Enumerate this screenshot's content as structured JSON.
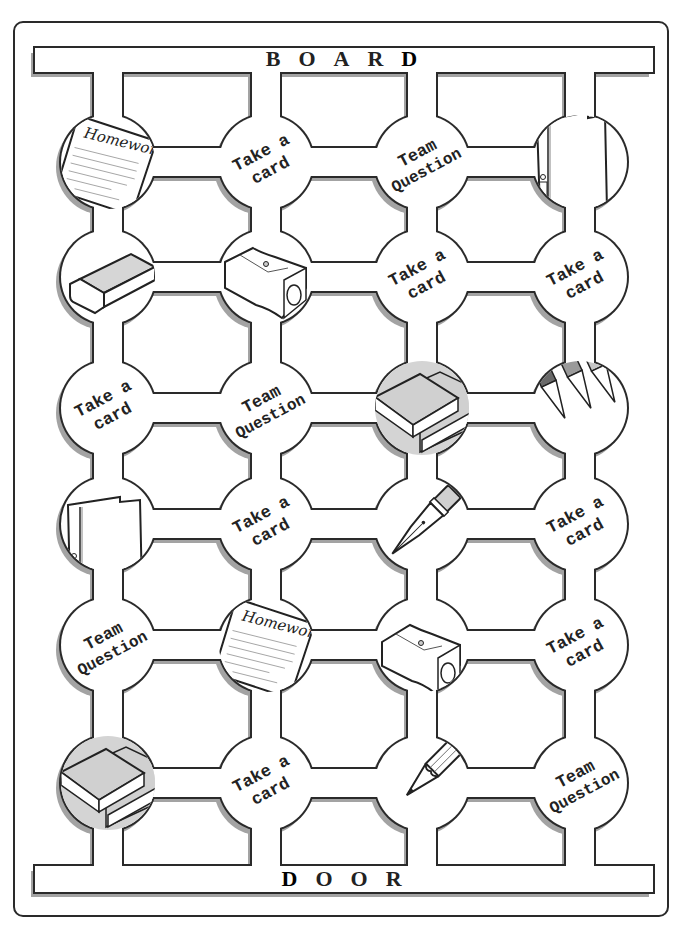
{
  "board": {
    "top_label": [
      "B",
      "O",
      "A",
      "R",
      "D"
    ],
    "bottom_label": [
      "D",
      "O",
      "O",
      "R"
    ],
    "frame_color": "#2a2a2a",
    "shadow_color": "#9a9a9a",
    "fill_gray": "#d0d0d0"
  },
  "spaces": [
    {
      "row": 0,
      "col": 0,
      "type": "image",
      "icon": "homework-sheet-icon",
      "title": "Homework"
    },
    {
      "row": 0,
      "col": 1,
      "type": "text",
      "line1": "Take a",
      "line2": "card"
    },
    {
      "row": 0,
      "col": 2,
      "type": "text",
      "line1": "Team",
      "line2": "Question"
    },
    {
      "row": 0,
      "col": 3,
      "type": "image",
      "icon": "binder-folder-icon"
    },
    {
      "row": 1,
      "col": 0,
      "type": "image",
      "icon": "eraser-icon"
    },
    {
      "row": 1,
      "col": 1,
      "type": "image",
      "icon": "pencil-sharpener-icon"
    },
    {
      "row": 1,
      "col": 2,
      "type": "text",
      "line1": "Take a",
      "line2": "card"
    },
    {
      "row": 1,
      "col": 3,
      "type": "text",
      "line1": "Take a",
      "line2": "card"
    },
    {
      "row": 2,
      "col": 0,
      "type": "text",
      "line1": "Take a",
      "line2": "card"
    },
    {
      "row": 2,
      "col": 1,
      "type": "text",
      "line1": "Team",
      "line2": "Question"
    },
    {
      "row": 2,
      "col": 2,
      "type": "image",
      "icon": "books-icon"
    },
    {
      "row": 2,
      "col": 3,
      "type": "image",
      "icon": "colored-pencils-icon"
    },
    {
      "row": 3,
      "col": 0,
      "type": "image",
      "icon": "binder-folder-icon"
    },
    {
      "row": 3,
      "col": 1,
      "type": "text",
      "line1": "Take a",
      "line2": "card"
    },
    {
      "row": 3,
      "col": 2,
      "type": "image",
      "icon": "fountain-pen-icon"
    },
    {
      "row": 3,
      "col": 3,
      "type": "text",
      "line1": "Take a",
      "line2": "card"
    },
    {
      "row": 4,
      "col": 0,
      "type": "text",
      "line1": "Team",
      "line2": "Question"
    },
    {
      "row": 4,
      "col": 1,
      "type": "image",
      "icon": "homework-sheet-icon",
      "title": "Homework"
    },
    {
      "row": 4,
      "col": 2,
      "type": "image",
      "icon": "pencil-sharpener-icon"
    },
    {
      "row": 4,
      "col": 3,
      "type": "text",
      "line1": "Take a",
      "line2": "card"
    },
    {
      "row": 5,
      "col": 0,
      "type": "image",
      "icon": "books-icon"
    },
    {
      "row": 5,
      "col": 1,
      "type": "text",
      "line1": "Take a",
      "line2": "card"
    },
    {
      "row": 5,
      "col": 2,
      "type": "image",
      "icon": "pencil-icon"
    },
    {
      "row": 5,
      "col": 3,
      "type": "text",
      "line1": "Team",
      "line2": "Question"
    }
  ]
}
